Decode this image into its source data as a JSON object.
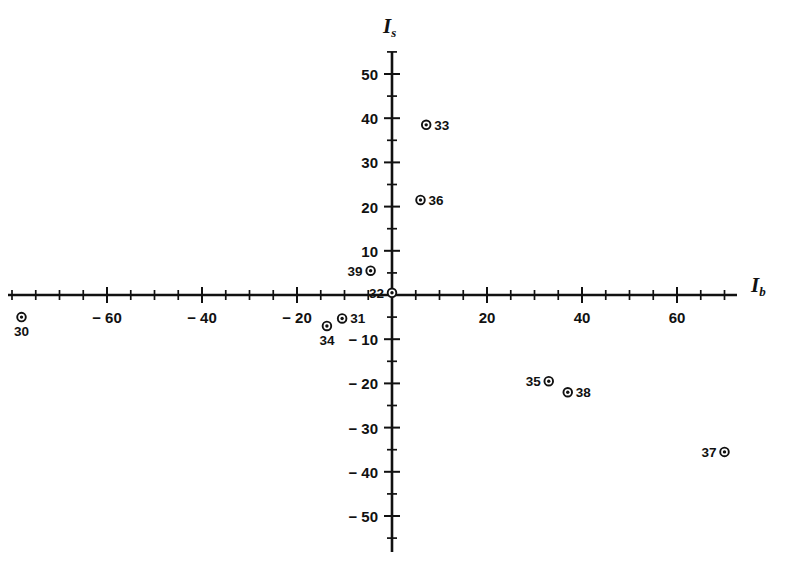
{
  "figure": {
    "background_color": "#ffffff",
    "ink_color": "#111111",
    "width": 796,
    "height": 565
  },
  "axes": {
    "x_title": "I",
    "x_title_sub": "b",
    "y_title": "I",
    "y_title_sub": "s",
    "origin_px": {
      "x": 392,
      "y": 295
    },
    "x_scale_px_per_unit": 4.75,
    "y_scale_px_per_unit": 4.42,
    "x_extent_px": {
      "left": 8,
      "right": 737
    },
    "y_extent_px": {
      "top": 52,
      "bottom": 552
    }
  },
  "chart_data": {
    "type": "scatter",
    "title": "",
    "subtitle": "",
    "xlabel": "I_b",
    "ylabel": "I_s",
    "xlim": [
      -81,
      72
    ],
    "ylim": [
      -58,
      55
    ],
    "grid": false,
    "legend": "none",
    "x_major_ticks": [
      -60,
      -40,
      -20,
      20,
      40,
      60
    ],
    "x_major_tick_labels": [
      "− 60",
      "− 40",
      "− 20",
      "20",
      "40",
      "60"
    ],
    "x_minor_tick_step": 5,
    "x_minor_tick_range": [
      -80,
      70
    ],
    "y_major_ticks": [
      50,
      40,
      30,
      20,
      10,
      -10,
      -20,
      -30,
      -40,
      -50
    ],
    "y_major_tick_labels": [
      "50",
      "40",
      "30",
      "20",
      "10",
      "− 10",
      "− 20",
      "− 30",
      "− 40",
      "− 50"
    ],
    "y_minor_tick_step": 5,
    "y_minor_tick_range": [
      -55,
      55
    ],
    "marker_style": "circle-with-dot",
    "points": [
      {
        "label": "30",
        "x": -78.0,
        "y": -5.0,
        "label_pos": "below"
      },
      {
        "label": "31",
        "x": -10.5,
        "y": -5.3,
        "label_pos": "right"
      },
      {
        "label": "32",
        "x": 0.0,
        "y": 0.5,
        "label_pos": "left"
      },
      {
        "label": "33",
        "x": 7.2,
        "y": 38.5,
        "label_pos": "right"
      },
      {
        "label": "34",
        "x": -13.7,
        "y": -7.0,
        "label_pos": "below"
      },
      {
        "label": "35",
        "x": 33.0,
        "y": -19.5,
        "label_pos": "left"
      },
      {
        "label": "36",
        "x": 6.0,
        "y": 21.5,
        "label_pos": "right"
      },
      {
        "label": "37",
        "x": 70.0,
        "y": -35.5,
        "label_pos": "left"
      },
      {
        "label": "38",
        "x": 37.0,
        "y": -22.0,
        "label_pos": "right"
      },
      {
        "label": "39",
        "x": -4.5,
        "y": 5.5,
        "label_pos": "left"
      }
    ]
  }
}
